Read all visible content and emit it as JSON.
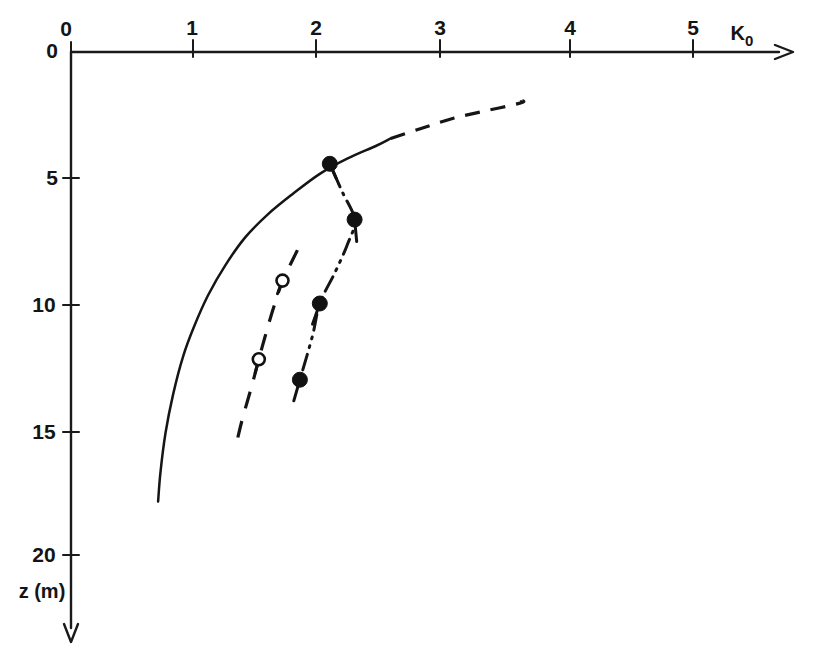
{
  "figure": {
    "title": "",
    "xaxis": {
      "label": "K",
      "label_sub": "0",
      "label_full": "K0",
      "ticks": [
        {
          "value": 0,
          "text": "0",
          "px": 71
        },
        {
          "value": 1,
          "text": "1",
          "px": 193
        },
        {
          "value": 2,
          "text": "2",
          "px": 316
        },
        {
          "value": 3,
          "text": "3",
          "px": 440
        },
        {
          "value": 4,
          "text": "4",
          "px": 570
        },
        {
          "value": 5,
          "text": "5",
          "px": 693
        }
      ],
      "min": 0,
      "max": 5.9,
      "arrow": "right"
    },
    "yaxis": {
      "label": "z (m)",
      "origin_text": "0",
      "ticks": [
        {
          "value": 5,
          "text": "5",
          "px": 178
        },
        {
          "value": 10,
          "text": "10",
          "px": 305
        },
        {
          "value": 15,
          "text": "15",
          "px": 432
        },
        {
          "value": 20,
          "text": "20",
          "px": 555
        }
      ],
      "min": 0,
      "max": 23.5,
      "arrow": "down"
    }
  },
  "chart_data": {
    "type": "line",
    "title": "",
    "xlabel": "K0",
    "ylabel": "z (m)",
    "xlim": [
      0,
      5.9
    ],
    "ylim": [
      0,
      23.5
    ],
    "y_inverted": true,
    "grid": false,
    "legend": "none",
    "series": [
      {
        "name": "K0 profile (solid, measured range)",
        "style": "solid",
        "marker": "none",
        "color": "#151515",
        "points": [
          {
            "K0": 0.7,
            "z": 17.7
          },
          {
            "K0": 0.72,
            "z": 16.5
          },
          {
            "K0": 0.76,
            "z": 15.0
          },
          {
            "K0": 0.82,
            "z": 13.5
          },
          {
            "K0": 0.9,
            "z": 12.0
          },
          {
            "K0": 0.99,
            "z": 10.8
          },
          {
            "K0": 1.1,
            "z": 9.6
          },
          {
            "K0": 1.24,
            "z": 8.4
          },
          {
            "K0": 1.4,
            "z": 7.3
          },
          {
            "K0": 1.58,
            "z": 6.4
          },
          {
            "K0": 1.78,
            "z": 5.6
          },
          {
            "K0": 2.0,
            "z": 4.8
          },
          {
            "K0": 2.22,
            "z": 4.2
          },
          {
            "K0": 2.45,
            "z": 3.7
          },
          {
            "K0": 2.57,
            "z": 3.4
          }
        ]
      },
      {
        "name": "K0 profile (dashed extrapolation)",
        "style": "dashed",
        "marker": "none",
        "color": "#151515",
        "points": [
          {
            "K0": 2.57,
            "z": 3.4
          },
          {
            "K0": 2.82,
            "z": 3.0
          },
          {
            "K0": 3.08,
            "z": 2.6
          },
          {
            "K0": 3.35,
            "z": 2.3
          },
          {
            "K0": 3.62,
            "z": 2.0
          },
          {
            "K0": 3.62,
            "z": 1.9
          }
        ]
      },
      {
        "name": "Test series A (dashed, open circles)",
        "style": "dashed",
        "marker": "open-circle",
        "color": "#151515",
        "points": [
          {
            "K0": 1.82,
            "z": 7.8
          },
          {
            "K0": 1.76,
            "z": 8.4
          },
          {
            "K0": 1.7,
            "z": 9.0
          },
          {
            "K0": 1.62,
            "z": 10.2
          },
          {
            "K0": 1.56,
            "z": 11.2
          },
          {
            "K0": 1.51,
            "z": 12.1
          },
          {
            "K0": 1.45,
            "z": 13.2
          },
          {
            "K0": 1.38,
            "z": 14.4
          },
          {
            "K0": 1.34,
            "z": 15.2
          }
        ],
        "marker_points": [
          {
            "K0": 1.7,
            "z": 9.0
          },
          {
            "K0": 1.51,
            "z": 12.1
          }
        ]
      },
      {
        "name": "Test series B (dash-dot, filled circles)",
        "style": "dash-dot-dot",
        "marker": "filled-circle",
        "color": "#121212",
        "points": [
          {
            "K0": 2.08,
            "z": 4.4
          },
          {
            "K0": 2.18,
            "z": 5.5
          },
          {
            "K0": 2.28,
            "z": 6.6
          },
          {
            "K0": 2.22,
            "z": 7.6
          },
          {
            "K0": 2.12,
            "z": 8.7
          },
          {
            "K0": 2.0,
            "z": 9.9
          },
          {
            "K0": 1.94,
            "z": 11.2
          },
          {
            "K0": 1.84,
            "z": 12.9
          }
        ],
        "marker_points": [
          {
            "K0": 2.08,
            "z": 4.4
          },
          {
            "K0": 2.28,
            "z": 6.6
          },
          {
            "K0": 2.0,
            "z": 9.9
          },
          {
            "K0": 1.84,
            "z": 12.9
          }
        ]
      }
    ]
  }
}
